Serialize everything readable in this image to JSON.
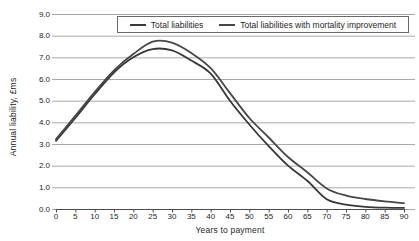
{
  "figure": {
    "background": "#ffffff"
  },
  "chart_data": {
    "type": "line",
    "title": "",
    "xlabel": "Years to payment",
    "ylabel": "Annual liability, £ms",
    "xlim": [
      0,
      90
    ],
    "ylim": [
      0,
      9
    ],
    "x_tick_step": 5,
    "y_tick_step": 1,
    "x_tick_labels": [
      "0",
      "5",
      "10",
      "15",
      "20",
      "25",
      "30",
      "35",
      "40",
      "45",
      "50",
      "55",
      "60",
      "65",
      "70",
      "75",
      "80",
      "85",
      "90"
    ],
    "y_tick_labels": [
      "0.0",
      "1.0",
      "2.0",
      "3.0",
      "4.0",
      "5.0",
      "6.0",
      "7.0",
      "8.0",
      "9.0"
    ],
    "grid": "horizontal",
    "legend_position": "top-center-boxed",
    "gridline_color": "#a9a9a9",
    "axis_color": "#4c4c4c",
    "text_color": "#262626",
    "x": [
      0,
      5,
      10,
      15,
      20,
      25,
      30,
      35,
      40,
      45,
      50,
      55,
      60,
      65,
      70,
      75,
      80,
      85,
      90
    ],
    "series": [
      {
        "name": "Total liabilities",
        "color": "#383838",
        "values": [
          3.15,
          4.2,
          5.3,
          6.3,
          7.0,
          7.38,
          7.32,
          6.85,
          6.25,
          5.0,
          3.9,
          2.9,
          2.0,
          1.3,
          0.45,
          0.2,
          0.1,
          0.06,
          0.05
        ]
      },
      {
        "name": "Total liabilities with mortality improvement",
        "color": "#474747",
        "values": [
          3.22,
          4.3,
          5.4,
          6.4,
          7.15,
          7.72,
          7.68,
          7.2,
          6.5,
          5.35,
          4.2,
          3.3,
          2.4,
          1.7,
          0.95,
          0.62,
          0.46,
          0.35,
          0.27
        ]
      }
    ]
  }
}
